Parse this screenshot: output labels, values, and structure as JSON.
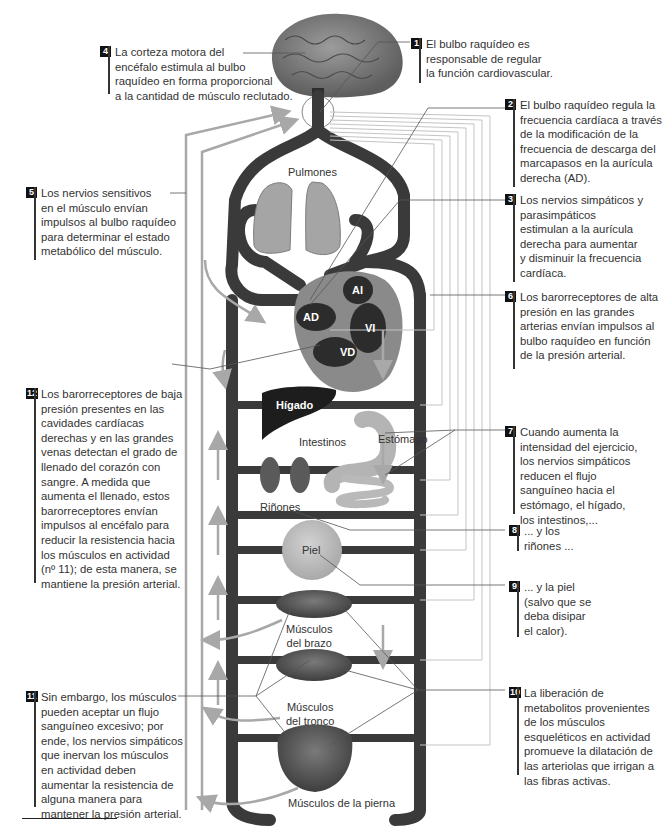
{
  "figure": {
    "type": "physiology-diagram",
    "topic": "Regulación cardiovascular durante el ejercicio",
    "colors": {
      "vessel": "#3a3a3a",
      "nerve_line": "#bdbdbd",
      "arrow": "#a8a8a8",
      "callout_badge": "#111111",
      "organ_tissue": "#9a9a9a",
      "muscle": "#5a5a5a"
    }
  },
  "organs": {
    "lungs": "Pulmones",
    "liver": "Hígado",
    "stomach": "Estómago",
    "intestines": "Intestinos",
    "kidneys": "Riñones",
    "skin": "Piel",
    "arm_muscles": "Músculos\ndel brazo",
    "trunk_muscles": "Músculos\ndel tronco",
    "leg_muscles": "Músculos de la pierna"
  },
  "heart": {
    "ra": "AD",
    "la": "AI",
    "rv": "VD",
    "lv": "VI"
  },
  "callouts": [
    {
      "num": "1",
      "text": "El bulbo raquídeo es\nresponsable de regular\nla función cardiovascular."
    },
    {
      "num": "2",
      "text": "El bulbo raquídeo regula la\nfrecuencia cardíaca a través\nde la modificación de la\nfrecuencia de descarga del\nmarcapasos en la aurícula\nderecha (AD)."
    },
    {
      "num": "3",
      "text": "Los nervios simpáticos y\nparasimpáticos\nestimulan a la aurícula\nderecha para aumentar\ny disminuir la frecuencia\ncardíaca."
    },
    {
      "num": "4",
      "text": "La corteza motora del\nencéfalo estimula al bulbo\nraquídeo en forma proporcional\na la cantidad de músculo reclutado."
    },
    {
      "num": "5",
      "text": "Los nervios sensitivos\nen el músculo envían\nimpulsos al bulbo raquídeo\npara determinar el estado\nmetabólico del músculo."
    },
    {
      "num": "6",
      "text": "Los barorreceptores de alta\npresión en las grandes\narterias envían impulsos al\nbulbo raquídeo en función\nde la presión arterial."
    },
    {
      "num": "7",
      "text": "Cuando aumenta la\nintensidad del ejercicio,\nlos nervios simpáticos\nreducen el flujo\nsanguíneo hacia el\nestómago, el hígado,\nlos intestinos,..."
    },
    {
      "num": "8",
      "text": "... y los\nriñones ..."
    },
    {
      "num": "9",
      "text": "... y la piel\n(salvo que se\ndeba disipar\nel calor)."
    },
    {
      "num": "10",
      "text": "La liberación de\nmetabolitos provenientes\nde los músculos\nesqueléticos en actividad\npromueve la dilatación de\nlas arteriolas que irrigan a\nlas fibras activas."
    },
    {
      "num": "11",
      "text": "Sin embargo, los músculos\npueden aceptar un flujo\nsanguíneo excesivo; por\nende, los nervios simpáticos\nque inervan los músculos\nen actividad deben\naumentar la resistencia de\nalguna manera para\nmantener la presión arterial."
    },
    {
      "num": "12",
      "text": "Los barorreceptores de baja\npresión presentes en las\ncavidades cardíacas\nderechas y en las grandes\nvenas detectan el grado de\nllenado del corazón con\nsangre. A medida que\naumenta el llenado, estos\nbarorreceptores envían\nimpulsos al encéfalo para\nreducir la resistencia hacia\nlos músculos en actividad\n(nº 11); de esta manera, se\nmantiene la presión arterial."
    }
  ]
}
